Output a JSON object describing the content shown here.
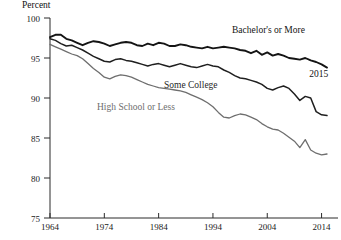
{
  "chart_data": {
    "type": "line",
    "title": "",
    "ylabel": "Percent",
    "xlabel": "",
    "ylim": [
      75,
      100
    ],
    "xlim": [
      1964,
      2015
    ],
    "grid": false,
    "legend_position": "inline-labels",
    "yticks": [
      "75",
      "80",
      "85",
      "90",
      "95",
      "100"
    ],
    "ytick_values": [
      75,
      80,
      85,
      90,
      95,
      100
    ],
    "xticks": [
      "1964",
      "1974",
      "1984",
      "1994",
      "2004",
      "2014"
    ],
    "xtick_values": [
      1964,
      1974,
      1984,
      1994,
      2004,
      2014
    ],
    "annotations": [
      {
        "text": "2015",
        "x": 2013.5,
        "y": 92.6
      }
    ],
    "x": [
      1964,
      1965,
      1966,
      1967,
      1968,
      1969,
      1970,
      1971,
      1972,
      1973,
      1974,
      1975,
      1976,
      1977,
      1978,
      1979,
      1980,
      1981,
      1982,
      1983,
      1984,
      1985,
      1986,
      1987,
      1988,
      1989,
      1990,
      1991,
      1992,
      1993,
      1994,
      1995,
      1996,
      1997,
      1998,
      1999,
      2000,
      2001,
      2002,
      2003,
      2004,
      2005,
      2006,
      2007,
      2008,
      2009,
      2010,
      2011,
      2012,
      2013,
      2014,
      2015
    ],
    "series": [
      {
        "name": "Bachelor's or More",
        "label": "Bachelor's or More",
        "color": "#141414",
        "width": 1.9,
        "values": [
          97.6,
          97.9,
          97.9,
          97.4,
          97.2,
          96.9,
          96.6,
          96.9,
          97.1,
          97.0,
          96.8,
          96.5,
          96.7,
          96.9,
          97.0,
          96.9,
          96.6,
          96.5,
          96.8,
          96.6,
          96.9,
          96.8,
          96.5,
          96.5,
          96.7,
          96.6,
          96.4,
          96.3,
          96.2,
          96.4,
          96.2,
          96.3,
          96.4,
          96.3,
          96.2,
          96.0,
          95.9,
          95.6,
          95.9,
          95.4,
          95.7,
          95.3,
          95.5,
          95.3,
          95.0,
          94.9,
          94.8,
          95.0,
          94.7,
          94.5,
          94.2,
          93.8
        ]
      },
      {
        "name": "Some College",
        "label": "Some College",
        "color": "#1f1f1f",
        "width": 1.5,
        "values": [
          97.4,
          97.2,
          96.8,
          96.5,
          96.6,
          96.3,
          96.0,
          95.6,
          95.2,
          94.9,
          94.6,
          94.5,
          94.8,
          94.9,
          94.7,
          94.6,
          94.4,
          94.2,
          94.0,
          94.2,
          94.3,
          94.1,
          93.9,
          94.1,
          94.3,
          94.1,
          93.9,
          93.8,
          94.0,
          94.2,
          94.0,
          93.9,
          93.5,
          93.2,
          92.8,
          92.5,
          92.4,
          92.2,
          92.0,
          91.7,
          91.2,
          91.0,
          91.3,
          91.5,
          91.2,
          90.5,
          89.7,
          90.2,
          90.0,
          88.3,
          87.9,
          87.8
        ]
      },
      {
        "name": "High School or Less",
        "label": "High School or Less",
        "color": "#6e6e6e",
        "width": 1.3,
        "values": [
          96.7,
          96.4,
          96.1,
          95.8,
          95.5,
          95.3,
          94.9,
          94.3,
          93.7,
          93.2,
          92.6,
          92.4,
          92.7,
          92.9,
          92.8,
          92.6,
          92.3,
          92.0,
          91.7,
          91.5,
          91.3,
          91.2,
          91.1,
          91.0,
          90.9,
          90.7,
          90.4,
          90.1,
          89.8,
          89.4,
          88.9,
          88.2,
          87.6,
          87.5,
          87.8,
          88.0,
          87.9,
          87.6,
          87.3,
          86.8,
          86.4,
          86.1,
          86.0,
          85.6,
          85.1,
          84.6,
          83.8,
          84.8,
          83.5,
          83.1,
          82.9,
          83.0
        ]
      }
    ],
    "series_label_positions": [
      {
        "series": "Bachelor's or More",
        "x": 232,
        "y": 33
      },
      {
        "series": "Some College",
        "x": 164,
        "y": 88
      },
      {
        "series": "High School or Less",
        "x": 97,
        "y": 110
      }
    ]
  }
}
